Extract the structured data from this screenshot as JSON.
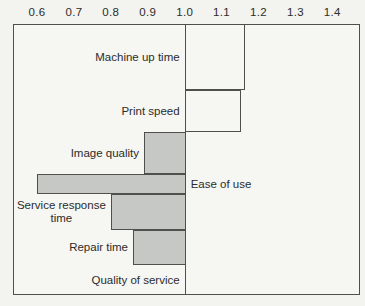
{
  "chart_data": {
    "type": "bar",
    "orientation": "horizontal",
    "title": "",
    "xlabel": "",
    "ylabel": "",
    "baseline": 1.0,
    "xlim": [
      0.535,
      1.475
    ],
    "x_ticks": [
      "0.6",
      "0.7",
      "0.8",
      "0.9",
      "1.0",
      "1.1",
      "1.2",
      "1.3",
      "1.4"
    ],
    "x_tick_values": [
      0.6,
      0.7,
      0.8,
      0.9,
      1.0,
      1.1,
      1.2,
      1.3,
      1.4
    ],
    "grid": "baseline-only",
    "legend": "none",
    "categories": [
      "Machine up time",
      "Print speed",
      "Image quality",
      "Ease of use",
      "Service response time",
      "Repair time",
      "Quality of service"
    ],
    "values": [
      1.16,
      1.15,
      0.89,
      0.6,
      0.8,
      0.86,
      1.0
    ],
    "bars": [
      {
        "label": "Machine up time",
        "value": 1.16,
        "fill": "white",
        "label_side": "left"
      },
      {
        "label": "Print speed",
        "value": 1.15,
        "fill": "white",
        "label_side": "left"
      },
      {
        "label": "Image quality",
        "value": 0.89,
        "fill": "gray",
        "label_side": "left"
      },
      {
        "label": "Ease of use",
        "value": 0.6,
        "fill": "gray",
        "label_side": "right"
      },
      {
        "label": "Service response\ntime",
        "value": 0.8,
        "fill": "gray",
        "label_side": "left"
      },
      {
        "label": "Repair time",
        "value": 0.86,
        "fill": "gray",
        "label_side": "left"
      },
      {
        "label": "Quality of service",
        "value": 1.0,
        "fill": "none",
        "label_side": "left"
      }
    ],
    "colors": {
      "gray_fill": "#c6c8c5",
      "white_fill": "#f6f6f3",
      "bar_border": "#4f4f4d",
      "text": "#2c2c2a",
      "background": "#f3f3f0"
    }
  }
}
